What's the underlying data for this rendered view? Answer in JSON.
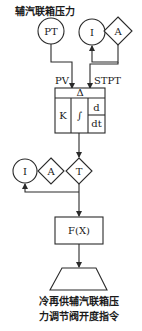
{
  "diagram": {
    "title": "辅汽联箱压力",
    "transmitter": {
      "label": "PT"
    },
    "setpoint": {
      "indicator": "I",
      "auto": "A"
    },
    "inputs": {
      "pv": "PV",
      "stpt": "STPT"
    },
    "pid_block": {
      "top": "Δ",
      "k": "K",
      "integral": "∫",
      "deriv_num": "d",
      "deriv_den": "dt"
    },
    "manual_station": {
      "indicator": "I",
      "auto": "A",
      "transfer": "T"
    },
    "function_block": {
      "label": "F(X)"
    },
    "output": {
      "line1": "冷再供辅汽联箱压",
      "line2": "力调节阀开度指令"
    },
    "colors": {
      "line": "#2a2a2a",
      "background": "#ffffff"
    }
  }
}
